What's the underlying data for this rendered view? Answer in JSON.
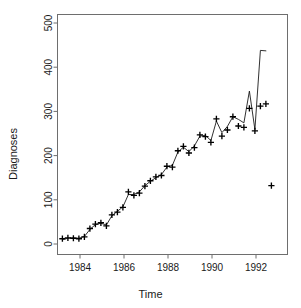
{
  "chart_data": {
    "type": "line",
    "title": "",
    "subtitle": "",
    "xlabel": "Time",
    "ylabel": "Diagnoses",
    "xlim": [
      1983.0,
      1992.9
    ],
    "ylim": [
      -15,
      520
    ],
    "xticks": [
      1984,
      1986,
      1988,
      1990,
      1992
    ],
    "xticklabels": [
      "1984",
      "1986",
      "1988",
      "1990",
      "1992"
    ],
    "yticks": [
      0,
      100,
      200,
      300,
      400,
      500
    ],
    "yticklabels": [
      "0",
      "100",
      "200",
      "300",
      "400",
      "500"
    ],
    "grid": false,
    "legend": null,
    "legend_position": "none",
    "box": true,
    "annotations": [],
    "series": [
      {
        "name": "Observed diagnoses",
        "marker": "plus",
        "style": "points",
        "color": "#000000",
        "x": [
          1983.2,
          1983.45,
          1983.7,
          1983.95,
          1984.2,
          1984.45,
          1984.7,
          1984.95,
          1985.2,
          1985.45,
          1985.7,
          1985.95,
          1986.2,
          1986.45,
          1986.7,
          1986.95,
          1987.2,
          1987.45,
          1987.7,
          1987.95,
          1988.2,
          1988.45,
          1988.7,
          1988.95,
          1989.2,
          1989.45,
          1989.7,
          1989.95,
          1990.2,
          1990.45,
          1990.7,
          1990.95,
          1991.2,
          1991.45,
          1991.7,
          1991.95,
          1992.2,
          1992.45,
          1992.7
        ],
        "y": [
          12,
          14,
          13,
          12,
          16,
          35,
          45,
          48,
          41,
          66,
          72,
          83,
          118,
          110,
          115,
          131,
          143,
          152,
          155,
          176,
          174,
          211,
          221,
          206,
          218,
          247,
          243,
          230,
          283,
          244,
          258,
          288,
          267,
          264,
          307,
          256,
          312,
          317,
          132
        ]
      },
      {
        "name": "Fitted / predicted",
        "marker": "none",
        "style": "line",
        "color": "#000000",
        "x": [
          1983.2,
          1983.45,
          1983.7,
          1983.95,
          1984.2,
          1984.45,
          1984.7,
          1984.95,
          1985.2,
          1985.45,
          1985.7,
          1985.95,
          1986.2,
          1986.45,
          1986.7,
          1986.95,
          1987.2,
          1987.45,
          1987.7,
          1987.95,
          1988.2,
          1988.45,
          1988.7,
          1988.95,
          1989.2,
          1989.45,
          1989.7,
          1989.95,
          1990.2,
          1990.45,
          1990.7,
          1990.95,
          1991.2,
          1991.45,
          1991.7,
          1991.95,
          1992.2,
          1992.45
        ],
        "y": [
          10,
          13,
          14,
          13,
          17,
          33,
          44,
          47,
          43,
          64,
          74,
          84,
          112,
          112,
          118,
          132,
          142,
          150,
          157,
          174,
          178,
          208,
          219,
          209,
          222,
          244,
          246,
          234,
          278,
          252,
          266,
          288,
          282,
          274,
          346,
          259,
          438,
          437
        ]
      }
    ]
  },
  "axes": {
    "ylabel_text": "Diagnoses",
    "xlabel_text": "Time"
  }
}
